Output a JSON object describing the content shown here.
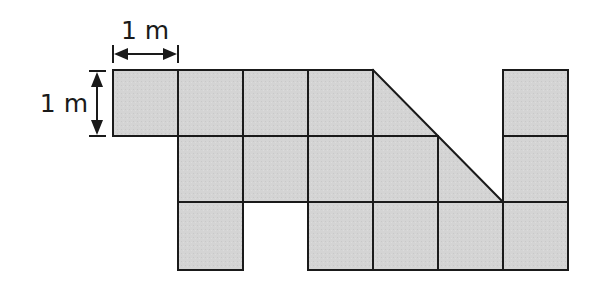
{
  "diagram": {
    "type": "grid-area-figure",
    "unit_label_horizontal": "1 m",
    "unit_label_vertical": "1 m",
    "fill_color": "#d4d4d4",
    "line_color": "#1a1a1a",
    "grid": {
      "columns": 7,
      "rows": 3,
      "cells": [
        {
          "row": 0,
          "col": 0,
          "shape": "square"
        },
        {
          "row": 0,
          "col": 1,
          "shape": "square"
        },
        {
          "row": 0,
          "col": 2,
          "shape": "square"
        },
        {
          "row": 0,
          "col": 3,
          "shape": "square"
        },
        {
          "row": 0,
          "col": 4,
          "shape": "half-triangle"
        },
        {
          "row": 0,
          "col": 6,
          "shape": "square"
        },
        {
          "row": 1,
          "col": 1,
          "shape": "square"
        },
        {
          "row": 1,
          "col": 2,
          "shape": "square"
        },
        {
          "row": 1,
          "col": 3,
          "shape": "square"
        },
        {
          "row": 1,
          "col": 4,
          "shape": "square"
        },
        {
          "row": 1,
          "col": 5,
          "shape": "half-triangle"
        },
        {
          "row": 1,
          "col": 6,
          "shape": "square"
        },
        {
          "row": 2,
          "col": 1,
          "shape": "square"
        },
        {
          "row": 2,
          "col": 3,
          "shape": "square"
        },
        {
          "row": 2,
          "col": 4,
          "shape": "square"
        },
        {
          "row": 2,
          "col": 5,
          "shape": "square"
        },
        {
          "row": 2,
          "col": 6,
          "shape": "square"
        }
      ]
    }
  }
}
